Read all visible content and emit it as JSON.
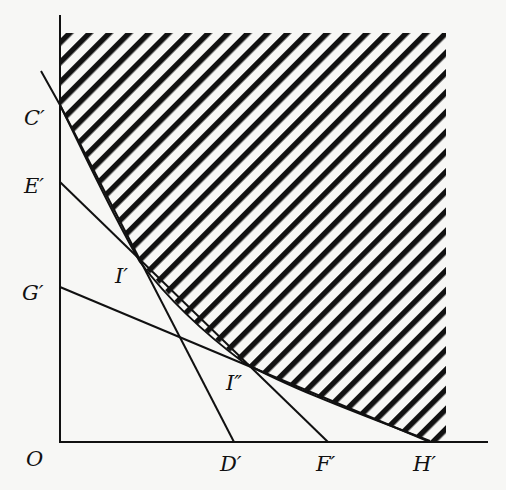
{
  "diagram": {
    "type": "indifference-curve-budget-lines",
    "colors": {
      "ink": "#111111",
      "paper": "#f7f7f5"
    },
    "axes": {
      "origin_label": "O",
      "origin": [
        61,
        443
      ],
      "y_axis_top": [
        60,
        15
      ],
      "x_axis_end": [
        488,
        442
      ]
    },
    "hatched_region": {
      "description": "area on/above the convex curve C'-I'-I''-H', bounded top at y=33 and right at x=446",
      "top": 33,
      "right": 446,
      "hatch_spacing": 20
    },
    "curve": {
      "name": "boundary-curve",
      "points": [
        [
          41,
          71
        ],
        [
          60,
          105
        ],
        [
          100,
          185
        ],
        [
          140,
          262
        ],
        [
          190,
          318
        ],
        [
          243,
          362
        ],
        [
          320,
          398
        ],
        [
          380,
          422
        ],
        [
          430,
          441
        ]
      ]
    },
    "lines": [
      {
        "name": "line-E-F",
        "from_label": "E'",
        "to_label": "F'",
        "from": [
          60,
          182
        ],
        "to": [
          328,
          442
        ]
      },
      {
        "name": "line-G-H",
        "from_label": "G'",
        "to_label": "H'",
        "from": [
          60,
          287
        ],
        "to": [
          430,
          441
        ]
      },
      {
        "name": "line-C-D",
        "from_label": "C'",
        "to_label": "D'",
        "from": [
          60,
          105
        ],
        "to": [
          234,
          442
        ]
      }
    ],
    "labels": {
      "C": "C′",
      "E": "E′",
      "G": "G′",
      "O": "O",
      "D": "D′",
      "F": "F′",
      "H": "H′",
      "I1": "I′",
      "I2": "I″"
    },
    "points": {
      "I1": [
        140,
        262
      ],
      "I2": [
        243,
        362
      ]
    }
  }
}
